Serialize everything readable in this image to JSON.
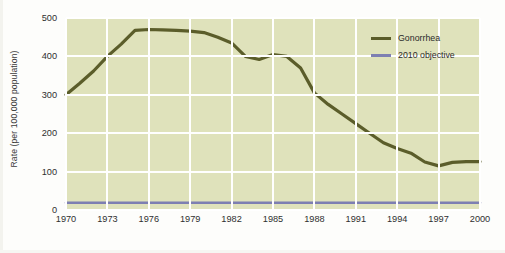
{
  "chart_data": {
    "type": "line",
    "title": "",
    "xlabel": "",
    "ylabel": "Rate (per 100,000 population)",
    "xlim": [
      1970,
      2000
    ],
    "ylim": [
      0,
      500
    ],
    "grid": true,
    "legend_position": "top-right",
    "y_ticks": [
      0,
      100,
      200,
      300,
      400,
      500
    ],
    "y_tick_labels": [
      "0",
      "100",
      "200",
      "300",
      "400",
      "500"
    ],
    "x_ticks": [
      1970,
      1973,
      1976,
      1979,
      1982,
      1985,
      1988,
      1991,
      1994,
      1997,
      2000
    ],
    "x_tick_labels": [
      "1970",
      "1973",
      "1976",
      "1979",
      "1982",
      "1985",
      "1988",
      "1991",
      "1994",
      "1997",
      "2000"
    ],
    "x": [
      1970,
      1971,
      1972,
      1973,
      1974,
      1975,
      1976,
      1977,
      1978,
      1979,
      1980,
      1981,
      1982,
      1983,
      1984,
      1985,
      1986,
      1987,
      1988,
      1989,
      1990,
      1991,
      1992,
      1993,
      1994,
      1995,
      1996,
      1997,
      1998,
      1999,
      2000
    ],
    "series": [
      {
        "name": "Gonorrhea",
        "color": "#5b5d2a",
        "values": [
          300,
          330,
          362,
          400,
          432,
          468,
          470,
          469,
          468,
          466,
          462,
          450,
          435,
          400,
          392,
          405,
          400,
          370,
          305,
          275,
          250,
          225,
          200,
          175,
          160,
          148,
          125,
          115,
          124,
          126,
          126
        ]
      },
      {
        "name": "2010 objective",
        "color": "#7d7fb2",
        "values": [
          19,
          19,
          19,
          19,
          19,
          19,
          19,
          19,
          19,
          19,
          19,
          19,
          19,
          19,
          19,
          19,
          19,
          19,
          19,
          19,
          19,
          19,
          19,
          19,
          19,
          19,
          19,
          19,
          19,
          19,
          19
        ]
      }
    ],
    "legend": [
      {
        "label": "Gonorrhea",
        "color": "#5b5d2a"
      },
      {
        "label": "2010 objective",
        "color": "#7d7fb2"
      }
    ],
    "plot_background_color": "#dfe2bb",
    "gridline_color": "#ffffff",
    "page_background_color": "#fdfdfb"
  }
}
